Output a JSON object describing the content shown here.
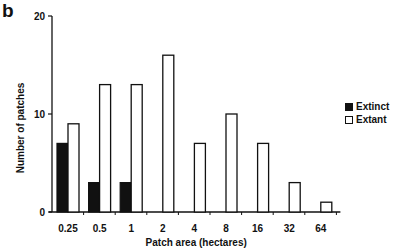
{
  "panel_label": "b",
  "chart_data": {
    "type": "bar",
    "title": "",
    "xlabel": "Patch area (hectares)",
    "ylabel": "Number of patches",
    "categories": [
      "0.25",
      "0.5",
      "1",
      "2",
      "4",
      "8",
      "16",
      "32",
      "64"
    ],
    "series": [
      {
        "name": "Extinct",
        "color": "#111111",
        "values": [
          7,
          3,
          3,
          0,
          0,
          0,
          0,
          0,
          0
        ]
      },
      {
        "name": "Extant",
        "color": "#ffffff",
        "values": [
          9,
          13,
          13,
          16,
          7,
          10,
          7,
          3,
          1
        ]
      }
    ],
    "yticks": [
      0,
      10,
      20
    ],
    "ylim": [
      0,
      20
    ],
    "grid": false,
    "legend_position": "right"
  },
  "legend": {
    "items": [
      {
        "label": "Extinct",
        "style": "filled"
      },
      {
        "label": "Extant",
        "style": "open"
      }
    ]
  }
}
